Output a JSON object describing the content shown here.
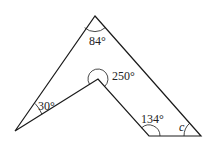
{
  "diagram": {
    "type": "polygon-angles",
    "vertices": {
      "top": [
        95,
        16
      ],
      "reflex": [
        98,
        79
      ],
      "left": [
        15,
        131
      ],
      "bottom_left": [
        149,
        136
      ],
      "bottom_right": [
        201,
        136
      ]
    },
    "angles": {
      "top": "84°",
      "reflex": "250°",
      "left": "30°",
      "bottom_left": "134°",
      "bottom_right": "c"
    },
    "colors": {
      "stroke": "#1a1a1a",
      "text": "#222222"
    }
  }
}
